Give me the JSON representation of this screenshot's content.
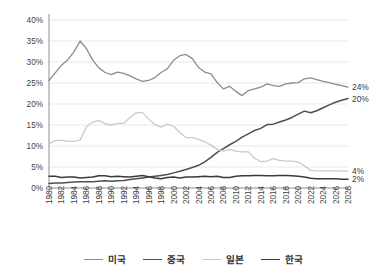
{
  "chart_data": {
    "type": "line",
    "title": "",
    "subtitle": "",
    "xlabel": "",
    "ylabel": "",
    "xlim": [
      1980,
      2028
    ],
    "ylim": [
      0,
      40
    ],
    "ytick_values": [
      0,
      5,
      10,
      15,
      20,
      25,
      30,
      35,
      40
    ],
    "ytick_labels": [
      "0%",
      "5%",
      "10%",
      "15%",
      "20%",
      "25%",
      "30%",
      "35%",
      "40%"
    ],
    "grid": true,
    "legend_position": "bottom",
    "x": [
      1980,
      1981,
      1982,
      1983,
      1984,
      1985,
      1986,
      1987,
      1988,
      1989,
      1990,
      1991,
      1992,
      1993,
      1994,
      1995,
      1996,
      1997,
      1998,
      1999,
      2000,
      2001,
      2002,
      2003,
      2004,
      2005,
      2006,
      2007,
      2008,
      2009,
      2010,
      2011,
      2012,
      2013,
      2014,
      2015,
      2016,
      2017,
      2018,
      2019,
      2020,
      2021,
      2022,
      2023,
      2024,
      2025,
      2026,
      2027,
      2028
    ],
    "xtick_labels": [
      "1980",
      "1982",
      "1984",
      "1986",
      "1988",
      "1990",
      "1992",
      "1994",
      "1996",
      "1998",
      "2000",
      "2002",
      "2004",
      "2006",
      "2008",
      "2010",
      "2012",
      "2014",
      "2016",
      "2018",
      "2020",
      "2022",
      "2024",
      "2026",
      "2028"
    ],
    "series": [
      {
        "name": "미국",
        "color": "#8c8c8c",
        "width": 1.3,
        "end_label": "24%",
        "values": [
          25.6,
          27.4,
          29.2,
          30.5,
          32.4,
          35.0,
          33.2,
          30.5,
          28.6,
          27.5,
          27.0,
          27.6,
          27.3,
          26.7,
          26.0,
          25.4,
          25.6,
          26.3,
          27.5,
          28.4,
          30.4,
          31.5,
          31.8,
          30.8,
          28.7,
          27.6,
          27.2,
          25.1,
          23.6,
          24.2,
          23.0,
          22.0,
          23.2,
          23.6,
          24.0,
          24.8,
          24.4,
          24.2,
          24.8,
          25.0,
          25.1,
          26.0,
          26.2,
          25.8,
          25.4,
          25.1,
          24.7,
          24.4,
          24.0
        ]
      },
      {
        "name": "중국",
        "color": "#4f4f4f",
        "width": 1.5,
        "end_label": "20%",
        "values": [
          1.1,
          1.2,
          1.2,
          1.3,
          1.4,
          1.5,
          1.5,
          1.5,
          1.6,
          1.7,
          1.6,
          1.7,
          1.8,
          2.0,
          2.2,
          2.4,
          2.6,
          2.8,
          3.0,
          3.2,
          3.6,
          4.0,
          4.4,
          4.9,
          5.4,
          6.2,
          7.3,
          8.5,
          9.4,
          10.3,
          11.1,
          12.1,
          12.9,
          13.7,
          14.2,
          15.1,
          15.2,
          15.7,
          16.2,
          16.8,
          17.6,
          18.3,
          17.9,
          18.4,
          19.1,
          19.8,
          20.4,
          20.9,
          21.3
        ]
      },
      {
        "name": "일본",
        "color": "#cacaca",
        "width": 1.3,
        "end_label": "4%",
        "values": [
          10.5,
          11.3,
          11.4,
          11.1,
          11.1,
          11.4,
          14.6,
          15.7,
          16.1,
          15.3,
          15.0,
          15.4,
          15.4,
          16.8,
          17.9,
          18.0,
          16.4,
          15.1,
          14.5,
          15.2,
          14.7,
          13.2,
          12.0,
          12.0,
          11.6,
          11.0,
          10.2,
          9.2,
          8.8,
          9.2,
          8.8,
          8.6,
          8.6,
          7.1,
          6.3,
          6.4,
          7.0,
          6.6,
          6.4,
          6.4,
          6.2,
          5.3,
          4.2,
          4.1,
          4.1,
          4.1,
          4.1,
          4.0,
          4.0
        ]
      },
      {
        "name": "한국",
        "color": "#3a3a3a",
        "width": 1.5,
        "end_label": "2%",
        "values": [
          2.8,
          2.8,
          2.5,
          2.6,
          2.6,
          2.4,
          2.5,
          2.6,
          2.9,
          2.9,
          2.7,
          2.8,
          2.7,
          2.6,
          2.8,
          3.0,
          2.7,
          2.4,
          2.2,
          2.5,
          2.6,
          2.4,
          2.6,
          2.6,
          2.7,
          2.8,
          2.7,
          2.8,
          2.5,
          2.5,
          2.8,
          2.9,
          2.9,
          3.0,
          3.0,
          2.9,
          2.9,
          3.0,
          3.0,
          2.9,
          2.8,
          2.6,
          2.3,
          2.2,
          2.2,
          2.2,
          2.2,
          2.1,
          2.1
        ]
      }
    ]
  }
}
